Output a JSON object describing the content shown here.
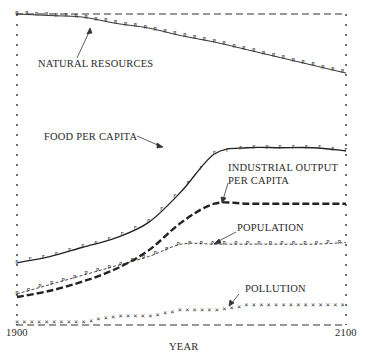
{
  "chart_data": {
    "type": "line",
    "title": "",
    "xlabel": "YEAR",
    "ylabel": "",
    "x_tick_labels": [
      "1900",
      "2100"
    ],
    "xlim": [
      1900,
      2100
    ],
    "ylim": [
      0,
      1
    ],
    "grid": false,
    "legend_position": "inline labels with arrows",
    "x": [
      1900,
      1920,
      1940,
      1960,
      1980,
      2000,
      2020,
      2040,
      2060,
      2080,
      2100
    ],
    "series": [
      {
        "name": "NATURAL RESOURCES",
        "style": "solid line with R markers",
        "values": [
          1.0,
          0.995,
          0.99,
          0.97,
          0.955,
          0.93,
          0.91,
          0.885,
          0.86,
          0.835,
          0.81
        ]
      },
      {
        "name": "FOOD PER CAPITA",
        "style": "solid line with F markers",
        "values": [
          0.2,
          0.22,
          0.25,
          0.28,
          0.33,
          0.43,
          0.55,
          0.57,
          0.57,
          0.57,
          0.56
        ]
      },
      {
        "name": "INDUSTRIAL OUTPUT PER CAPITA",
        "style": "heavy dashed line",
        "values": [
          0.09,
          0.11,
          0.14,
          0.18,
          0.24,
          0.33,
          0.39,
          0.39,
          0.39,
          0.39,
          0.39
        ]
      },
      {
        "name": "POPULATION",
        "style": "dash line with P markers",
        "values": [
          0.1,
          0.13,
          0.16,
          0.19,
          0.22,
          0.26,
          0.26,
          0.26,
          0.26,
          0.26,
          0.265
        ]
      },
      {
        "name": "POLLUTION",
        "style": "x markers, stepwise",
        "values": [
          0.005,
          0.005,
          0.005,
          0.025,
          0.025,
          0.045,
          0.045,
          0.06,
          0.06,
          0.06,
          0.06
        ]
      }
    ],
    "reference_lines": [
      {
        "name": "upper bound",
        "style": "dashed",
        "value": 1.0
      },
      {
        "name": "lower bound",
        "style": "dashed",
        "value": 0.0
      }
    ]
  },
  "labels": {
    "natural_resources": "NATURAL RESOURCES",
    "food_per_capita": "FOOD PER CAPITA",
    "industrial_output_1": "INDUSTRIAL OUTPUT",
    "industrial_output_2": "PER CAPITA",
    "population": "POPULATION",
    "pollution": "POLLUTION",
    "x_start": "1900",
    "x_end": "2100",
    "x_axis": "YEAR"
  }
}
